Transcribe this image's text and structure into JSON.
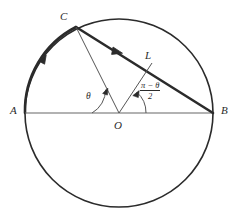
{
  "figure": {
    "type": "geometry-diagram",
    "background_color": "#ffffff",
    "stroke_color": "#2b2b2b",
    "thin_stroke_color": "#555555"
  },
  "labels": {
    "A": "A",
    "B": "B",
    "C": "C",
    "O": "O",
    "L": "L",
    "theta": "θ",
    "angle_fraction_numerator": "π − θ",
    "angle_fraction_denominator": "2"
  },
  "geometry": {
    "circle": {
      "cx": 119,
      "cy": 113,
      "r": 94
    },
    "points": {
      "A": {
        "x": 25,
        "y": 113
      },
      "B": {
        "x": 213,
        "y": 113
      },
      "C": {
        "x": 76,
        "y": 27
      },
      "O": {
        "x": 119,
        "y": 113
      },
      "L": {
        "x": 152,
        "y": 63
      }
    },
    "segments": [
      {
        "name": "diameter-AB",
        "from": "A",
        "to": "B",
        "weight": "thin"
      },
      {
        "name": "chord-CB",
        "from": "C",
        "to": "B",
        "weight": "thick",
        "arrow": "toward-B"
      },
      {
        "name": "radius-CO",
        "from": "C",
        "to": "O",
        "weight": "thin"
      },
      {
        "name": "segment-OL",
        "from": "O",
        "to": "L",
        "weight": "thin"
      }
    ],
    "arcs": [
      {
        "name": "arc-AC",
        "weight": "thick",
        "arrow": "counterclockwise"
      }
    ],
    "angle_marks": [
      {
        "name": "angle-theta",
        "at": "O",
        "between": [
          "A",
          "C"
        ],
        "label": "θ"
      },
      {
        "name": "angle-half-pi-minus-theta",
        "at": "O",
        "between": [
          "L",
          "B"
        ],
        "label": "(π − θ)/2"
      }
    ]
  }
}
